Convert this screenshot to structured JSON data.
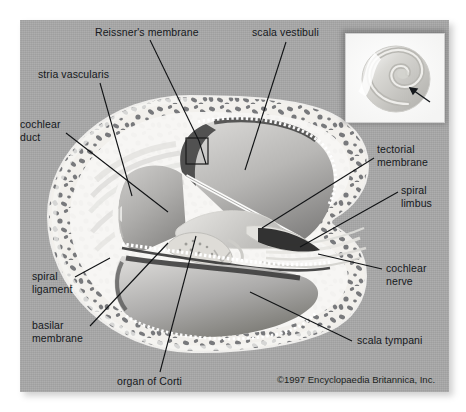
{
  "figure": {
    "credit": "©1997 Encyclopaedia Britannica, Inc.",
    "background_color": "#ffffff",
    "plate_color": "#a8a8a8",
    "text_color": "#15181c"
  },
  "labels": [
    {
      "id": "reissners-membrane",
      "text": "Reissner's membrane",
      "lines": [
        "Reissner's membrane"
      ]
    },
    {
      "id": "scala-vestibuli",
      "text": "scala vestibuli",
      "lines": [
        "scala vestibuli"
      ]
    },
    {
      "id": "stria-vascularis",
      "text": "stria vascularis",
      "lines": [
        "stria vascularis"
      ]
    },
    {
      "id": "cochlear-duct",
      "text": "cochlear duct",
      "lines": [
        "cochlear",
        "duct"
      ]
    },
    {
      "id": "tectorial-membrane",
      "text": "tectorial membrane",
      "lines": [
        "tectorial",
        "membrane"
      ]
    },
    {
      "id": "spiral-limbus",
      "text": "spiral limbus",
      "lines": [
        "spiral",
        "limbus"
      ]
    },
    {
      "id": "cochlear-nerve",
      "text": "cochlear nerve",
      "lines": [
        "cochlear",
        "nerve"
      ]
    },
    {
      "id": "scala-tympani",
      "text": "scala tympani",
      "lines": [
        "scala tympani"
      ]
    },
    {
      "id": "spiral-ligament",
      "text": "spiral ligament",
      "lines": [
        "spiral",
        "ligament"
      ]
    },
    {
      "id": "basilar-membrane",
      "text": "basilar membrane",
      "lines": [
        "basilar",
        "membrane"
      ]
    },
    {
      "id": "organ-of-corti",
      "text": "organ of Corti",
      "lines": [
        "organ of Corti"
      ]
    }
  ],
  "label_text": {
    "reissners_membrane": "Reissner's membrane",
    "scala_vestibuli": "scala vestibuli",
    "stria_vascularis": "stria vascularis",
    "cochlear_duct_l1": "cochlear",
    "cochlear_duct_l2": "duct",
    "tectorial_membrane_l1": "tectorial",
    "tectorial_membrane_l2": "membrane",
    "spiral_limbus_l1": "spiral",
    "spiral_limbus_l2": "limbus",
    "cochlear_nerve_l1": "cochlear",
    "cochlear_nerve_l2": "nerve",
    "scala_tympani": "scala tympani",
    "spiral_ligament_l1": "spiral",
    "spiral_ligament_l2": "ligament",
    "basilar_membrane_l1": "basilar",
    "basilar_membrane_l2": "membrane",
    "organ_of_corti": "organ of Corti"
  },
  "inset": {
    "name": "cochlea-spiral-inset",
    "description": "whole cochlear spiral with arrow marking section level"
  }
}
